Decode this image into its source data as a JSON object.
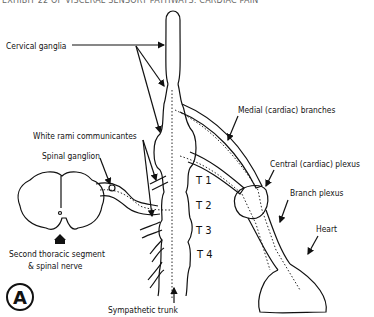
{
  "header": {
    "text": "EXHIBIT 22 OF VISCERAL SENSORY PATHWAYS: CARDIAC PAIN"
  },
  "labels": {
    "cervical_ganglia": "Cervical ganglia",
    "white_rami": "White rami communicantes",
    "spinal_ganglion": "Spinal ganglion",
    "second_thoracic_line1": "Second thoracic segment",
    "second_thoracic_line2": "& spinal nerve",
    "sympathetic_trunk": "Sympathetic trunk",
    "medial_branches": "Medial (cardiac) branches",
    "central_plexus": "Central (cardiac) plexus",
    "branch_plexus": "Branch plexus",
    "heart": "Heart"
  },
  "segments": [
    "T 1",
    "T 2",
    "T 3",
    "T 4"
  ],
  "panel_letter": "A",
  "colors": {
    "line": "#111111",
    "background": "#ffffff"
  }
}
